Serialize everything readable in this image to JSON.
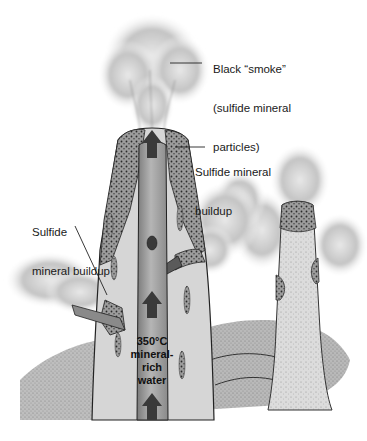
{
  "diagram": {
    "labels": {
      "smoke": {
        "lines": [
          "Black “smoke”",
          "(sulfide mineral",
          "particles)"
        ]
      },
      "buildup_top": {
        "lines": [
          "Sulfide mineral",
          "buildup"
        ]
      },
      "buildup_left": {
        "lines": [
          "Sulfide",
          "mineral buildup"
        ]
      },
      "water": {
        "lines": [
          "350°C",
          "mineral-",
          "rich",
          "water"
        ]
      }
    },
    "icons": {
      "flow_arrow": "up-arrow"
    },
    "colors": {
      "chimney_wall": "#d4d4d4",
      "conduit": "#9a9a9a",
      "sulfide_buildup": "#8c8c8c",
      "arrow": "#3a3a3a",
      "smoke": "#8a8a8a",
      "outline": "#222222"
    }
  }
}
